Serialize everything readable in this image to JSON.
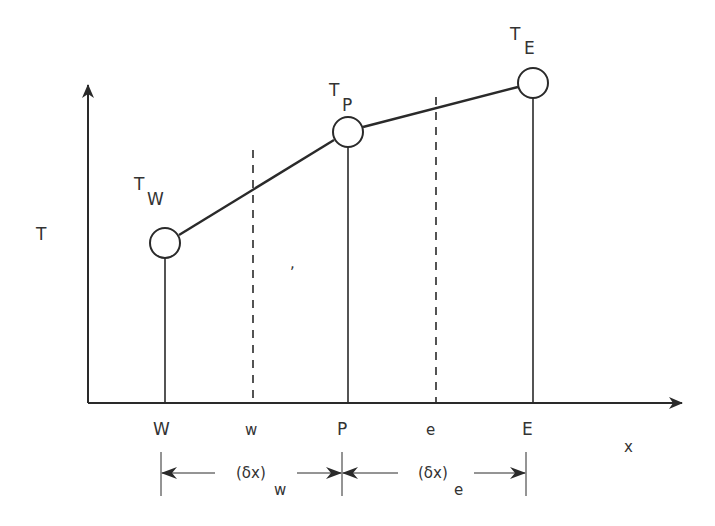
{
  "diagram": {
    "type": "finite-volume-1d-temperature-profile",
    "colors": {
      "background": "#ffffff",
      "ink": "#2a2a2a",
      "text": "#333333"
    },
    "axes": {
      "y_label": "T",
      "x_label": "x"
    },
    "nodes": [
      {
        "id": "W",
        "axis_label": "W",
        "value_label_main": "T",
        "value_label_sub": "W"
      },
      {
        "id": "P",
        "axis_label": "P",
        "value_label_main": "T",
        "value_label_sub": "P"
      },
      {
        "id": "E",
        "axis_label": "E",
        "value_label_main": "T",
        "value_label_sub": "E"
      }
    ],
    "faces": [
      {
        "id": "w",
        "axis_label": "w"
      },
      {
        "id": "e",
        "axis_label": "e"
      }
    ],
    "dimensions": [
      {
        "id": "dx_w",
        "label_main": "(δx)",
        "label_sub": "w"
      },
      {
        "id": "dx_e",
        "label_main": "(δx)",
        "label_sub": "e"
      }
    ],
    "stray_mark": ","
  }
}
